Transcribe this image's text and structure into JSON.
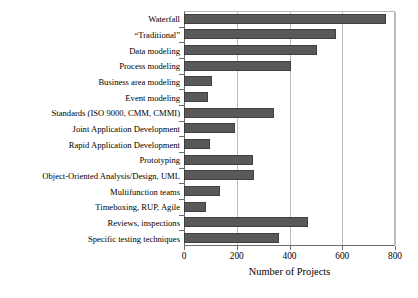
{
  "chart_data": {
    "type": "bar",
    "orientation": "horizontal",
    "title": "",
    "xlabel": "Number of Projects",
    "ylabel": "",
    "xlim": [
      0,
      800
    ],
    "xticks": [
      0,
      200,
      400,
      600,
      800
    ],
    "grid": true,
    "legend": null,
    "bar_color": "#595959",
    "categories": [
      "Waterfall",
      "“Traditional”",
      "Data modeling",
      "Process modeling",
      "Business area modeling",
      "Event modeling",
      "Standards (ISO 9000, CMM, CMMI)",
      "Joint Application Development",
      "Rapid Application Development",
      "Prototyping",
      "Object-Oriented Analysis/Design, UML",
      "Multifunction teams",
      "Timeboxing, RUP, Agile",
      "Reviews, inspections",
      "Specific testing techniques"
    ],
    "values": [
      765,
      575,
      505,
      405,
      105,
      90,
      340,
      195,
      100,
      260,
      265,
      135,
      85,
      470,
      360
    ]
  }
}
